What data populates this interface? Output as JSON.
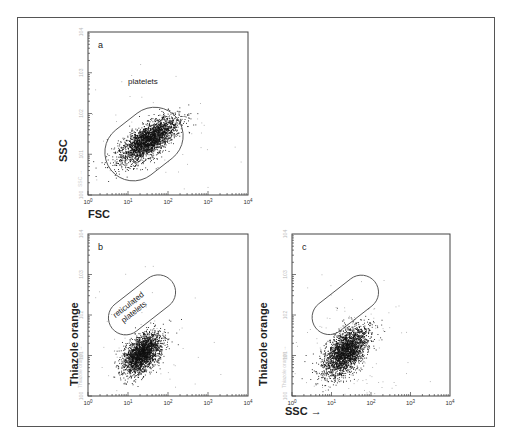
{
  "figure": {
    "panels": [
      {
        "id": "a",
        "label": "a",
        "gate_label": [
          "platelets"
        ]
      },
      {
        "id": "b",
        "label": "b",
        "gate_label": [
          "reticulated",
          "platelets"
        ]
      },
      {
        "id": "c",
        "label": "c",
        "gate_label": []
      }
    ],
    "axis_titles": {
      "a_y": "SSC",
      "a_x": "FSC",
      "b_y": "Thiazole orange",
      "c_y": "Thiazole orange",
      "c_x": "SSC →"
    },
    "faint_axis_labels": {
      "a_y": "SSC →",
      "b_y": "Thiazole orange →",
      "c_y": "Thiazole orange →"
    }
  },
  "chart_data": [
    {
      "type": "scatter",
      "title": "a",
      "xlabel": "FSC",
      "ylabel": "SSC",
      "xscale": "log",
      "yscale": "log",
      "xlim": [
        1,
        10000
      ],
      "ylim": [
        1,
        10000
      ],
      "xticks": [
        "10^0",
        "10^1",
        "10^2",
        "10^3",
        "10^4"
      ],
      "yticks": [
        "10^0",
        "10^1",
        "10^2",
        "10^3",
        "10^4"
      ],
      "annotations": [
        "platelets"
      ],
      "gate": {
        "shape": "rounded-capsule",
        "center_log": [
          1.4,
          1.25
        ],
        "angle_deg": 38,
        "length_log": 2.1,
        "width_log": 1.4
      },
      "population": {
        "center_log": [
          1.5,
          1.35
        ],
        "spread_major": 0.42,
        "spread_minor": 0.17,
        "angle_deg": 35,
        "n": 2600
      },
      "background": {
        "n": 60
      }
    },
    {
      "type": "scatter",
      "title": "b",
      "xlabel": "SSC",
      "ylabel": "Thiazole orange",
      "xscale": "log",
      "yscale": "log",
      "xlim": [
        1,
        10000
      ],
      "ylim": [
        1,
        10000
      ],
      "xticks": [
        "10^0",
        "10^1",
        "10^2",
        "10^3",
        "10^4"
      ],
      "yticks": [
        "10^0",
        "10^1",
        "10^2",
        "10^3",
        "10^4"
      ],
      "annotations": [
        "reticulated platelets"
      ],
      "gate": {
        "shape": "rounded-capsule",
        "center_log": [
          1.35,
          2.25
        ],
        "angle_deg": 38,
        "length_log": 1.9,
        "width_log": 0.85
      },
      "population": {
        "center_log": [
          1.35,
          1.05
        ],
        "spread_major": 0.3,
        "spread_minor": 0.17,
        "angle_deg": 48,
        "n": 2300
      },
      "background": {
        "n": 80
      }
    },
    {
      "type": "scatter",
      "title": "c",
      "xlabel": "SSC",
      "ylabel": "Thiazole orange",
      "xscale": "log",
      "yscale": "log",
      "xlim": [
        1,
        10000
      ],
      "ylim": [
        1,
        10000
      ],
      "xticks": [
        "10^0",
        "10^1",
        "10^2",
        "10^3",
        "10^4"
      ],
      "yticks": [
        "10^0",
        "10^1",
        "10^2",
        "10^3",
        "10^4"
      ],
      "annotations": [],
      "gate": {
        "shape": "rounded-capsule",
        "center_log": [
          1.35,
          2.25
        ],
        "angle_deg": 38,
        "length_log": 1.9,
        "width_log": 0.85
      },
      "population": {
        "center_log": [
          1.35,
          1.1
        ],
        "spread_major": 0.36,
        "spread_minor": 0.2,
        "angle_deg": 50,
        "n": 2400
      },
      "background": {
        "n": 120
      }
    }
  ]
}
